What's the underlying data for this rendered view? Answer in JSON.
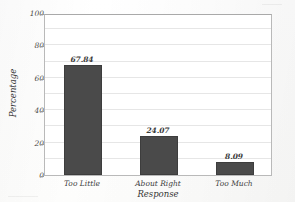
{
  "chart_data": {
    "type": "bar",
    "title": "",
    "xlabel": "Response",
    "ylabel": "Percentage",
    "categories": [
      "Too Little",
      "About Right",
      "Too Much"
    ],
    "values": [
      67.84,
      24.07,
      8.09
    ],
    "data_labels": [
      "67.84",
      "24.07",
      "8.09"
    ],
    "ylim": [
      0,
      100
    ],
    "yticks": [
      0,
      20,
      40,
      60,
      80,
      100
    ],
    "ytick_labels": [
      "0",
      "20",
      "40",
      "60",
      "80",
      "100"
    ],
    "grid": true,
    "grid_interval": 10,
    "legend": false,
    "bar_color": "#4a4a4a",
    "grid_color": "#e6e6e6",
    "frame_color": "#b9b9b9"
  },
  "axes": {
    "y_title": "Percentage",
    "x_title": "Response"
  }
}
